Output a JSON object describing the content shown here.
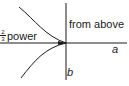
{
  "diagram": {
    "labels": {
      "region": "from above",
      "curve_exponent_numerator": "2",
      "curve_exponent_denominator": "3",
      "curve_label": "power",
      "horizontal_axis": "a",
      "vertical_axis": "b"
    },
    "colors": {
      "line": "#1a1a1a",
      "background": "#ffffff"
    }
  }
}
